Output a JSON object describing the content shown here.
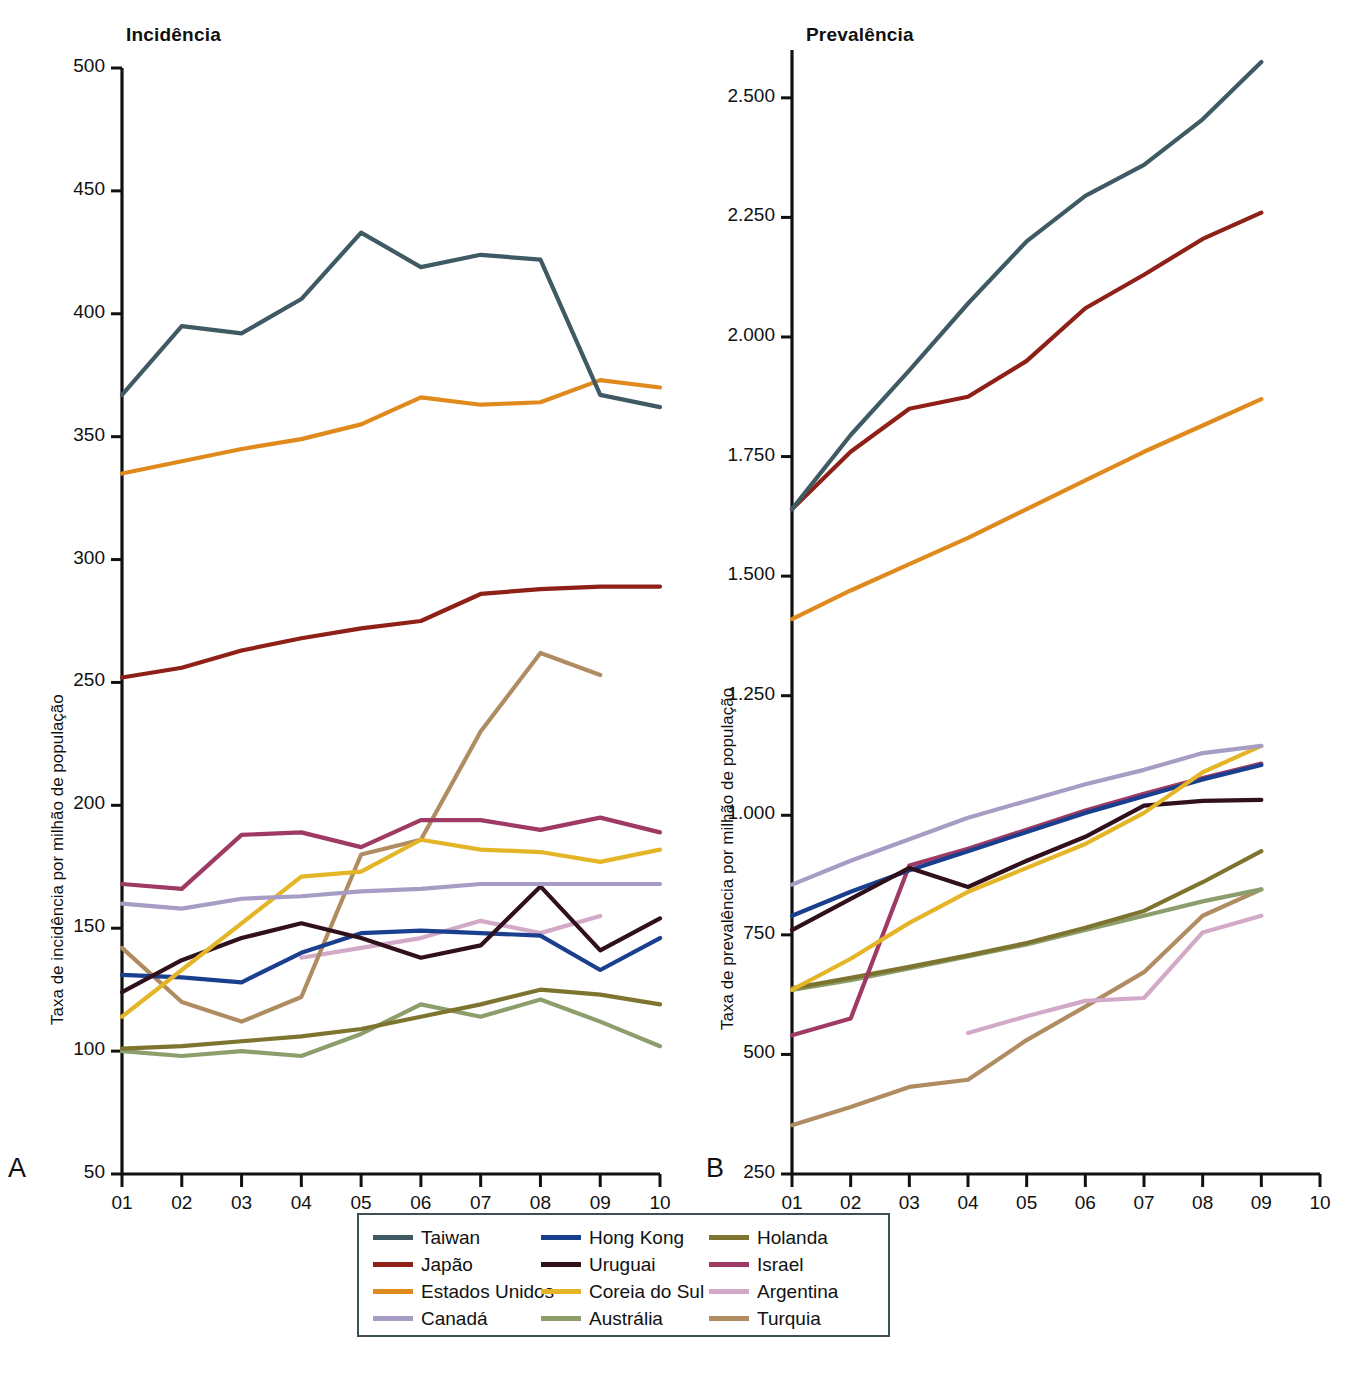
{
  "figure": {
    "panels": [
      {
        "letter": "A",
        "title": "Incidência",
        "ylabel": "Taxa de incidência por milhão de população"
      },
      {
        "letter": "B",
        "title": "Prevalência",
        "ylabel": "Taxa de prevalência por milhão de população"
      }
    ],
    "caption": ""
  },
  "legend": {
    "items": [
      {
        "label": "Taiwan",
        "color": "#3f5a63"
      },
      {
        "label": "Hong Kong",
        "color": "#1b3f8f"
      },
      {
        "label": "Holanda",
        "color": "#7d7430"
      },
      {
        "label": "Japão",
        "color": "#8f2018"
      },
      {
        "label": "Uruguai",
        "color": "#30101c"
      },
      {
        "label": "Israel",
        "color": "#9e3a63"
      },
      {
        "label": "Estados Unidos",
        "color": "#e08a1e"
      },
      {
        "label": "Coreia do Sul",
        "color": "#e5b528"
      },
      {
        "label": "Argentina",
        "color": "#d3a9c8"
      },
      {
        "label": "Canadá",
        "color": "#a79cc4"
      },
      {
        "label": "Austrália",
        "color": "#8d9e6d"
      },
      {
        "label": "Turquia",
        "color": "#b08c62"
      }
    ]
  },
  "chart_data": [
    {
      "type": "line",
      "panel": "A",
      "title": "Incidência",
      "xlabel": "",
      "ylabel": "Taxa de incidência por milhão de população",
      "x": [
        "01",
        "02",
        "03",
        "04",
        "05",
        "06",
        "07",
        "08",
        "09",
        "10"
      ],
      "xticklabels": [
        "01",
        "02",
        "03",
        "04",
        "05",
        "06",
        "07",
        "08",
        "09",
        "10"
      ],
      "yticklabels": [
        "50",
        "100",
        "150",
        "200",
        "250",
        "300",
        "350",
        "400",
        "450",
        "500"
      ],
      "ylim": [
        50,
        500
      ],
      "grid": false,
      "legend_position": "below",
      "series": [
        {
          "name": "Taiwan",
          "color": "#3f5a63",
          "x": [
            "01",
            "02",
            "03",
            "04",
            "05",
            "06",
            "07",
            "08",
            "09",
            "10"
          ],
          "values": [
            367,
            395,
            392,
            406,
            433,
            419,
            424,
            422,
            367,
            362
          ]
        },
        {
          "name": "Japão",
          "color": "#8f2018",
          "x": [
            "01",
            "02",
            "03",
            "04",
            "05",
            "06",
            "07",
            "08",
            "09",
            "10"
          ],
          "values": [
            252,
            256,
            263,
            268,
            272,
            275,
            286,
            288,
            289,
            289
          ]
        },
        {
          "name": "Estados Unidos",
          "color": "#e08a1e",
          "x": [
            "01",
            "02",
            "03",
            "04",
            "05",
            "06",
            "07",
            "08",
            "09",
            "10"
          ],
          "values": [
            335,
            340,
            345,
            349,
            355,
            366,
            363,
            364,
            373,
            370
          ]
        },
        {
          "name": "Canadá",
          "color": "#a79cc4",
          "x": [
            "01",
            "02",
            "03",
            "04",
            "05",
            "06",
            "07",
            "08",
            "09",
            "10"
          ],
          "values": [
            160,
            158,
            162,
            163,
            165,
            166,
            168,
            168,
            168,
            168
          ]
        },
        {
          "name": "Hong Kong",
          "color": "#1b3f8f",
          "x": [
            "01",
            "02",
            "03",
            "04",
            "05",
            "06",
            "07",
            "08",
            "09",
            "10"
          ],
          "values": [
            131,
            130,
            128,
            140,
            148,
            149,
            148,
            147,
            133,
            146
          ]
        },
        {
          "name": "Uruguai",
          "color": "#30101c",
          "x": [
            "01",
            "02",
            "03",
            "04",
            "05",
            "06",
            "07",
            "08",
            "09",
            "10"
          ],
          "values": [
            124,
            137,
            146,
            152,
            146,
            138,
            143,
            167,
            141,
            154
          ]
        },
        {
          "name": "Coreia do Sul",
          "color": "#e5b528",
          "x": [
            "01",
            "02",
            "03",
            "04",
            "05",
            "06",
            "07",
            "08",
            "09",
            "10"
          ],
          "values": [
            114,
            133,
            152,
            171,
            173,
            186,
            182,
            181,
            177,
            182
          ]
        },
        {
          "name": "Austrália",
          "color": "#8d9e6d",
          "x": [
            "01",
            "02",
            "03",
            "04",
            "05",
            "06",
            "07",
            "08",
            "09",
            "10"
          ],
          "values": [
            100,
            98,
            100,
            98,
            107,
            119,
            114,
            121,
            112,
            102
          ]
        },
        {
          "name": "Holanda",
          "color": "#7d7430",
          "x": [
            "01",
            "02",
            "03",
            "04",
            "05",
            "06",
            "07",
            "08",
            "09",
            "10"
          ],
          "values": [
            101,
            102,
            104,
            106,
            109,
            114,
            119,
            125,
            123,
            119
          ]
        },
        {
          "name": "Israel",
          "color": "#9e3a63",
          "x": [
            "01",
            "02",
            "03",
            "04",
            "05",
            "06",
            "07",
            "08",
            "09",
            "10"
          ],
          "values": [
            168,
            166,
            188,
            189,
            183,
            194,
            194,
            190,
            195,
            189
          ]
        },
        {
          "name": "Argentina",
          "color": "#d3a9c8",
          "x": [
            "04",
            "05",
            "06",
            "07",
            "08",
            "09"
          ],
          "values": [
            138,
            142,
            146,
            153,
            148,
            155
          ]
        },
        {
          "name": "Turquia",
          "color": "#b08c62",
          "x": [
            "01",
            "02",
            "03",
            "04",
            "05",
            "06",
            "07",
            "08",
            "09"
          ],
          "values": [
            142,
            120,
            112,
            122,
            180,
            186,
            230,
            262,
            253
          ]
        }
      ]
    },
    {
      "type": "line",
      "panel": "B",
      "title": "Prevalência",
      "xlabel": "",
      "ylabel": "Taxa de prevalência por milhão de população",
      "x": [
        "01",
        "02",
        "03",
        "04",
        "05",
        "06",
        "07",
        "08",
        "09",
        "10"
      ],
      "xticklabels": [
        "01",
        "02",
        "03",
        "04",
        "05",
        "06",
        "07",
        "08",
        "09",
        "10"
      ],
      "yticklabels": [
        "250",
        "500",
        "750",
        "1.000",
        "1.250",
        "1.500",
        "1.750",
        "2.000",
        "2.250",
        "2.500"
      ],
      "ylim": [
        250,
        2600
      ],
      "grid": false,
      "legend_position": "below",
      "series": [
        {
          "name": "Taiwan",
          "color": "#3f5a63",
          "x": [
            "01",
            "02",
            "03",
            "04",
            "05",
            "06",
            "07",
            "08",
            "09"
          ],
          "values": [
            1640,
            1795,
            1930,
            2070,
            2200,
            2295,
            2360,
            2455,
            2575
          ]
        },
        {
          "name": "Japão",
          "color": "#8f2018",
          "x": [
            "01",
            "02",
            "03",
            "04",
            "05",
            "06",
            "07",
            "08",
            "09"
          ],
          "values": [
            1640,
            1760,
            1850,
            1875,
            1950,
            2060,
            2130,
            2205,
            2260
          ]
        },
        {
          "name": "Estados Unidos",
          "color": "#e08a1e",
          "x": [
            "01",
            "02",
            "03",
            "04",
            "05",
            "06",
            "07",
            "08",
            "09"
          ],
          "values": [
            1410,
            1470,
            1525,
            1580,
            1640,
            1700,
            1760,
            1815,
            1870
          ]
        },
        {
          "name": "Canadá",
          "color": "#a79cc4",
          "x": [
            "01",
            "02",
            "03",
            "04",
            "05",
            "06",
            "07",
            "08",
            "09"
          ],
          "values": [
            855,
            905,
            950,
            995,
            1030,
            1065,
            1095,
            1130,
            1145
          ]
        },
        {
          "name": "Hong Kong",
          "color": "#1b3f8f",
          "x": [
            "01",
            "02",
            "03",
            "04",
            "05",
            "06",
            "07",
            "08",
            "09"
          ],
          "values": [
            790,
            840,
            885,
            925,
            965,
            1005,
            1040,
            1075,
            1105
          ]
        },
        {
          "name": "Uruguai",
          "color": "#30101c",
          "x": [
            "01",
            "02",
            "03",
            "04",
            "05",
            "06",
            "07",
            "08",
            "09"
          ],
          "values": [
            760,
            825,
            890,
            850,
            905,
            955,
            1020,
            1030,
            1032
          ]
        },
        {
          "name": "Coreia do Sul",
          "color": "#e5b528",
          "x": [
            "01",
            "02",
            "03",
            "04",
            "05",
            "06",
            "07",
            "08",
            "09"
          ],
          "values": [
            635,
            700,
            775,
            840,
            890,
            940,
            1005,
            1090,
            1145
          ]
        },
        {
          "name": "Austrália",
          "color": "#8d9e6d",
          "x": [
            "01",
            "02",
            "03",
            "04",
            "05",
            "06",
            "07",
            "08",
            "09"
          ],
          "values": [
            635,
            655,
            680,
            705,
            730,
            760,
            790,
            820,
            845
          ]
        },
        {
          "name": "Holanda",
          "color": "#7d7430",
          "x": [
            "01",
            "02",
            "03",
            "04",
            "05",
            "06",
            "07",
            "08",
            "09"
          ],
          "values": [
            638,
            660,
            683,
            707,
            733,
            765,
            800,
            860,
            925
          ]
        },
        {
          "name": "Israel",
          "color": "#9e3a63",
          "x": [
            "01",
            "02",
            "03",
            "04",
            "05",
            "06",
            "07",
            "08",
            "09"
          ],
          "values": [
            540,
            575,
            895,
            930,
            970,
            1010,
            1045,
            1078,
            1108
          ]
        },
        {
          "name": "Argentina",
          "color": "#d3a9c8",
          "x": [
            "04",
            "05",
            "06",
            "07",
            "08",
            "09"
          ],
          "values": [
            545,
            580,
            612,
            618,
            755,
            790
          ]
        },
        {
          "name": "Turquia",
          "color": "#b08c62",
          "x": [
            "01",
            "02",
            "03",
            "04",
            "05",
            "06",
            "07",
            "08",
            "09"
          ],
          "values": [
            352,
            390,
            432,
            447,
            530,
            600,
            672,
            790,
            845
          ]
        }
      ]
    }
  ]
}
